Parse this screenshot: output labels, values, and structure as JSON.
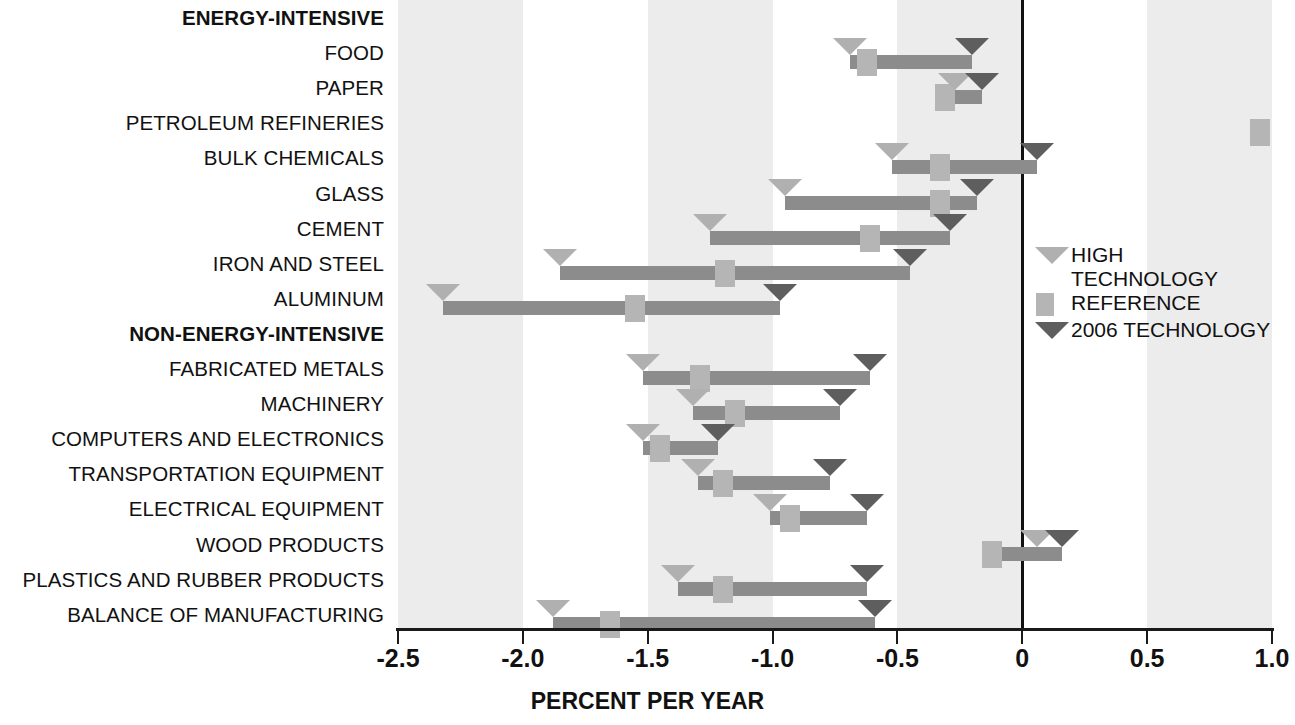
{
  "chart_data": {
    "type": "bar",
    "title": "",
    "xlabel": "PERCENT PER YEAR",
    "ylabel": "",
    "xlim": [
      -2.5,
      1.0
    ],
    "xticks": [
      -2.5,
      -2.0,
      -1.5,
      -1.0,
      -0.5,
      0,
      0.5,
      1.0
    ],
    "xtick_labels": [
      "-2.5",
      "-2.0",
      "-1.5",
      "-1.0",
      "-0.5",
      "0",
      "0.5",
      "1.0"
    ],
    "grid": false,
    "bands": "alternating light grey stripes every 0.5 units",
    "legend_position": "right-middle",
    "legend": [
      {
        "name": "HIGH TECHNOLOGY",
        "marker": "down-triangle",
        "color": "#b0b0b0"
      },
      {
        "name": "REFERENCE",
        "marker": "square",
        "color": "#b5b5b5"
      },
      {
        "name": "2006 TECHNOLOGY",
        "marker": "down-triangle",
        "color": "#5e5e5e"
      }
    ],
    "series": [
      {
        "name": "HIGH TECHNOLOGY",
        "color": "#b0b0b0"
      },
      {
        "name": "REFERENCE",
        "color": "#b5b5b5"
      },
      {
        "name": "2006 TECHNOLOGY",
        "color": "#5e5e5e"
      }
    ],
    "groups": [
      {
        "label": "ENERGY-INTENSIVE",
        "is_header": true,
        "rows": [
          {
            "category": "FOOD",
            "high_technology": -0.69,
            "reference": -0.62,
            "technology_2006": -0.2
          },
          {
            "category": "PAPER",
            "high_technology": -0.27,
            "reference": -0.31,
            "technology_2006": -0.16
          },
          {
            "category": "PETROLEUM REFINERIES",
            "high_technology": null,
            "reference": 0.95,
            "technology_2006": null
          },
          {
            "category": "BULK CHEMICALS",
            "high_technology": -0.52,
            "reference": -0.33,
            "technology_2006": 0.06
          },
          {
            "category": "GLASS",
            "high_technology": -0.95,
            "reference": -0.33,
            "technology_2006": -0.18
          },
          {
            "category": "CEMENT",
            "high_technology": -1.25,
            "reference": -0.61,
            "technology_2006": -0.29
          },
          {
            "category": "IRON AND STEEL",
            "high_technology": -1.85,
            "reference": -1.19,
            "technology_2006": -0.45
          },
          {
            "category": "ALUMINUM",
            "high_technology": -2.32,
            "reference": -1.55,
            "technology_2006": -0.97
          }
        ]
      },
      {
        "label": "NON-ENERGY-INTENSIVE",
        "is_header": true,
        "rows": [
          {
            "category": "FABRICATED METALS",
            "high_technology": -1.52,
            "reference": -1.29,
            "technology_2006": -0.61
          },
          {
            "category": "MACHINERY",
            "high_technology": -1.32,
            "reference": -1.15,
            "technology_2006": -0.73
          },
          {
            "category": "COMPUTERS AND ELECTRONICS",
            "high_technology": -1.52,
            "reference": -1.45,
            "technology_2006": -1.22
          },
          {
            "category": "TRANSPORTATION EQUIPMENT",
            "high_technology": -1.3,
            "reference": -1.2,
            "technology_2006": -0.77
          },
          {
            "category": "ELECTRICAL EQUIPMENT",
            "high_technology": -1.01,
            "reference": -0.93,
            "technology_2006": -0.62
          },
          {
            "category": "WOOD PRODUCTS",
            "high_technology": 0.06,
            "reference": -0.12,
            "technology_2006": 0.16
          },
          {
            "category": "PLASTICS AND RUBBER PRODUCTS",
            "high_technology": -1.38,
            "reference": -1.2,
            "technology_2006": -0.62
          },
          {
            "category": "BALANCE OF MANUFACTURING",
            "high_technology": -1.88,
            "reference": -1.65,
            "technology_2006": -0.59
          }
        ]
      }
    ]
  },
  "legend": {
    "high_technology": "HIGH\nTECHNOLOGY",
    "reference": "REFERENCE",
    "technology_2006": "2006 TECHNOLOGY"
  },
  "axis": {
    "title": "PERCENT PER YEAR"
  }
}
